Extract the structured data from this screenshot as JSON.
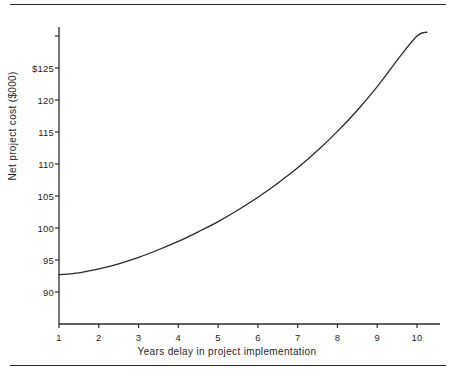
{
  "chart_data": {
    "type": "line",
    "title": "",
    "subtitle": "",
    "xlabel": "Years delay in project implementation",
    "ylabel": "Net project cost ($000)",
    "xlim": [
      1,
      10.6
    ],
    "ylim": [
      87.5,
      131.5
    ],
    "grid": false,
    "legend": null,
    "xticks": [
      1,
      2,
      3,
      4,
      5,
      6,
      7,
      8,
      9,
      10
    ],
    "xtick_labels": [
      "1",
      "2",
      "3",
      "4",
      "5",
      "6",
      "7",
      "8",
      "9",
      "10"
    ],
    "yticks": [
      90,
      95,
      100,
      105,
      110,
      115,
      120,
      125
    ],
    "ytick_labels": [
      "90",
      "95",
      "100",
      "105",
      "110",
      "115",
      "120",
      "$125"
    ],
    "series": [
      {
        "name": "Net project cost",
        "color": "#26262b",
        "x": [
          1,
          1.5,
          2,
          2.5,
          3,
          3.5,
          4,
          4.5,
          5,
          5.5,
          6,
          6.5,
          7,
          7.5,
          8,
          8.5,
          9,
          9.5,
          10,
          10.25
        ],
        "values": [
          92.7,
          93.0,
          93.6,
          94.4,
          95.4,
          96.6,
          97.9,
          99.4,
          101.0,
          102.8,
          104.8,
          107.0,
          109.4,
          112.1,
          115.1,
          118.4,
          122.1,
          126.2,
          130.0,
          130.6
        ]
      }
    ],
    "annotations": []
  },
  "axes": {
    "x_axis_line": "horizontal axis with outward ticks below",
    "y_axis_line": "vertical axis with outward ticks to the left"
  },
  "decorations": {
    "top_rule": "horizontal rule",
    "bottom_rule": "horizontal rule"
  }
}
